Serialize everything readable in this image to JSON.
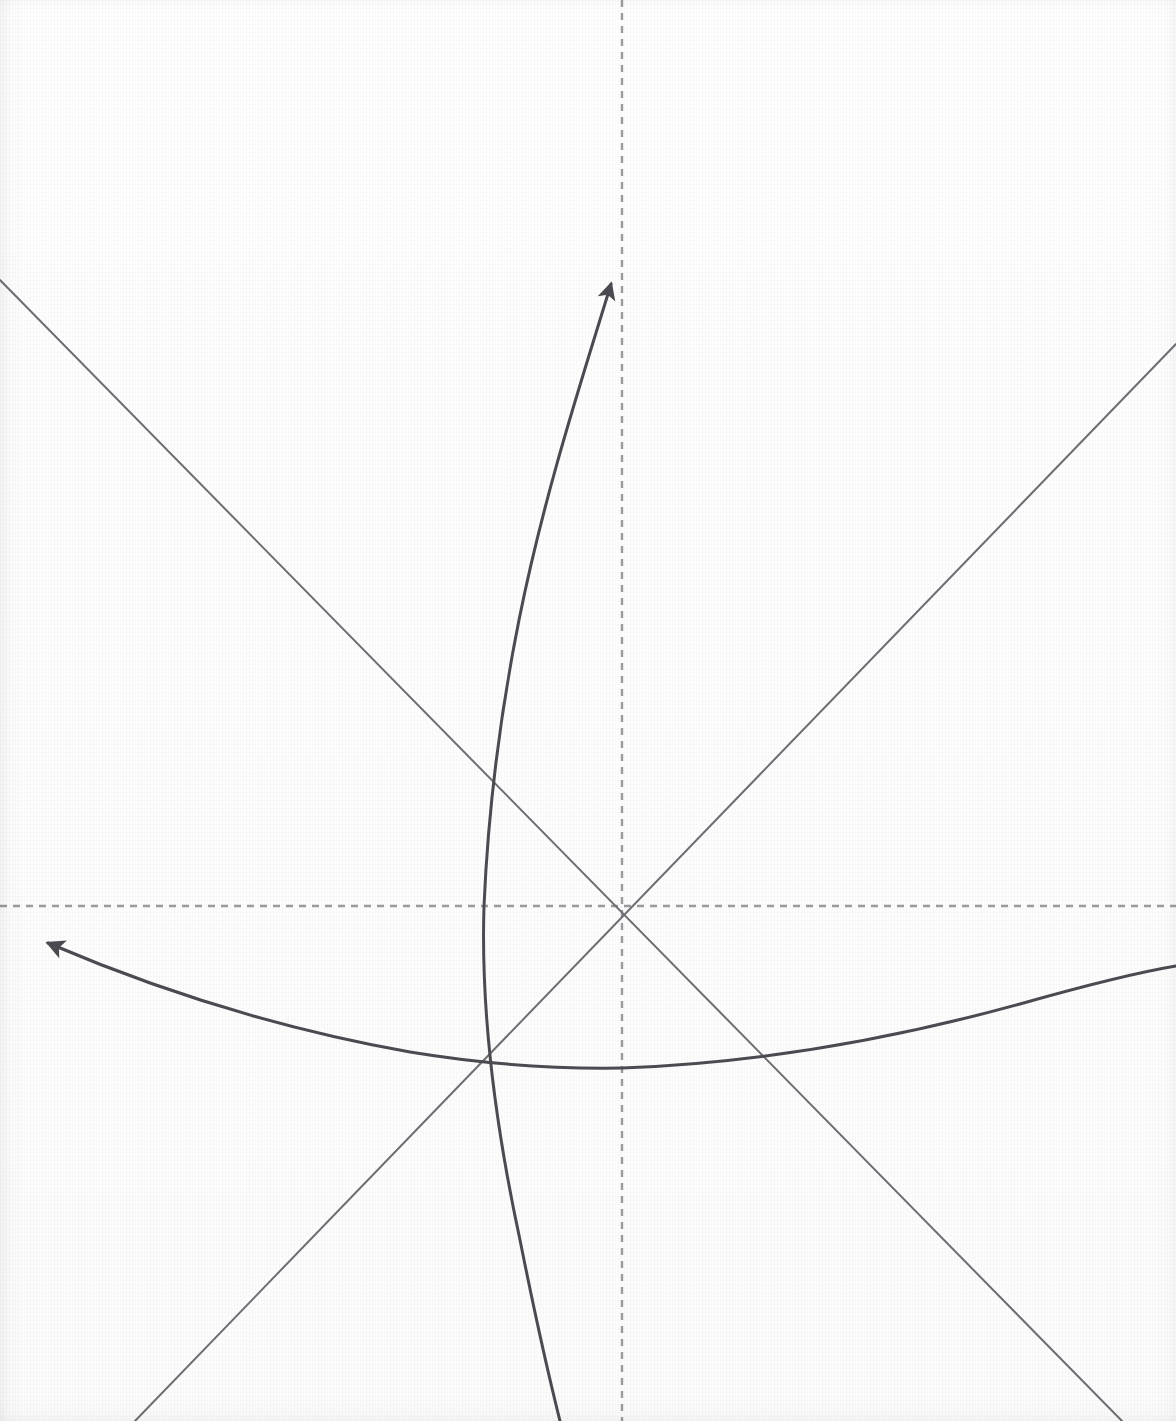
{
  "figure": {
    "canvas": {
      "width": 1176,
      "height": 1421
    },
    "background_color": "#fdfdfd",
    "origin": {
      "x": 622,
      "y": 906
    }
  },
  "colors": {
    "axis_dashed": "#9a9a9e",
    "straight_line": "#6d6d73",
    "curve_stroke": "#4a4a50",
    "arrowhead_fill": "#4a4a50",
    "paper": "#fdfdfd"
  },
  "strokes": {
    "axis_width": 2.4,
    "axis_dash": "7 6",
    "straight_width": 2.0,
    "curve_width": 3.0
  },
  "chart_data": {
    "type": "line",
    "title": "",
    "xlabel": "",
    "ylabel": "",
    "grid": false,
    "legend_position": "none",
    "xlim": [
      0,
      1176
    ],
    "ylim": [
      1421,
      0
    ],
    "annotations": [],
    "series": [
      {
        "name": "vertical-dashed-axis",
        "style": "dashed",
        "color": "#9a9a9e",
        "path": "M 622 0 L 622 1421",
        "points": [
          [
            622,
            0
          ],
          [
            622,
            1421
          ]
        ]
      },
      {
        "name": "horizontal-dashed-axis",
        "style": "dashed",
        "color": "#9a9a9e",
        "path": "M 0 906 L 1176 906",
        "points": [
          [
            0,
            906
          ],
          [
            1176,
            906
          ]
        ]
      },
      {
        "name": "descending-straight-ray",
        "style": "solid-thin",
        "color": "#6d6d73",
        "path": "M 0 280 L 1122 1421",
        "points": [
          [
            0,
            280
          ],
          [
            622,
            906
          ],
          [
            1122,
            1421
          ]
        ]
      },
      {
        "name": "ascending-straight-ray",
        "style": "solid-thin",
        "color": "#6d6d73",
        "path": "M 135 1421 L 1176 344",
        "points": [
          [
            135,
            1421
          ],
          [
            622,
            906
          ],
          [
            1176,
            344
          ]
        ]
      },
      {
        "name": "vertical-curve-arrow",
        "style": "solid-curve-arrow",
        "color": "#4a4a50",
        "arrow_at": "start",
        "arrow_tip": [
          611,
          284
        ],
        "arrow_direction_deg": -68,
        "points": [
          [
            611,
            284
          ],
          [
            560,
            460
          ],
          [
            519,
            620
          ],
          [
            497,
            740
          ],
          [
            487,
            840
          ],
          [
            483,
            906
          ],
          [
            484,
            1000
          ],
          [
            497,
            1110
          ],
          [
            522,
            1240
          ],
          [
            560,
            1421
          ]
        ]
      },
      {
        "name": "horizontal-curve-arrow",
        "style": "solid-curve-arrow",
        "color": "#4a4a50",
        "arrow_at": "start",
        "arrow_tip": [
          31,
          937
        ],
        "arrow_direction_deg": 196,
        "points": [
          [
            31,
            937
          ],
          [
            150,
            985
          ],
          [
            280,
            1024
          ],
          [
            400,
            1048
          ],
          [
            500,
            1061
          ],
          [
            610,
            1068
          ],
          [
            720,
            1063
          ],
          [
            840,
            1046
          ],
          [
            960,
            1018
          ],
          [
            1080,
            988
          ],
          [
            1176,
            967
          ]
        ]
      }
    ]
  },
  "elements": {
    "vertical_axis_label": "vertical dashed axis",
    "horizontal_axis_label": "horizontal dashed axis",
    "ray_down_label": "descending straight ray",
    "ray_up_label": "ascending straight ray",
    "curve_vertical_label": "upward curved arrow",
    "curve_horizontal_label": "leftward curved arrow",
    "origin_label": "origin intersection"
  }
}
